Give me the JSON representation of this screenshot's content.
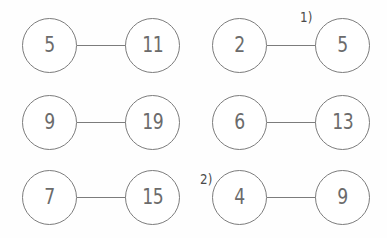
{
  "worksheet": {
    "background_color": "#fefefe",
    "stroke_color": "#7c7c7c",
    "text_color": "#6b6b6b",
    "label_color": "#4a4a4a",
    "pairs": [
      {
        "id": "pair-r1c1",
        "left_value": "5",
        "right_value": "11",
        "left_x": 22,
        "right_x": 125,
        "top": 18
      },
      {
        "id": "pair-r1c2",
        "left_value": "2",
        "right_value": "5",
        "left_x": 212,
        "right_x": 315,
        "top": 18
      },
      {
        "id": "pair-r2c1",
        "left_value": "9",
        "right_value": "19",
        "left_x": 22,
        "right_x": 125,
        "top": 95
      },
      {
        "id": "pair-r2c2",
        "left_value": "6",
        "right_value": "13",
        "left_x": 212,
        "right_x": 315,
        "top": 95
      },
      {
        "id": "pair-r3c1",
        "left_value": "7",
        "right_value": "15",
        "left_x": 22,
        "right_x": 125,
        "top": 170
      },
      {
        "id": "pair-r3c2",
        "left_value": "4",
        "right_value": "9",
        "left_x": 212,
        "right_x": 315,
        "top": 170
      }
    ],
    "problem_labels": [
      {
        "id": "label-1",
        "text": "1)",
        "x": 299,
        "y": 10
      },
      {
        "id": "label-2",
        "text": "2)",
        "x": 199,
        "y": 172
      }
    ]
  }
}
